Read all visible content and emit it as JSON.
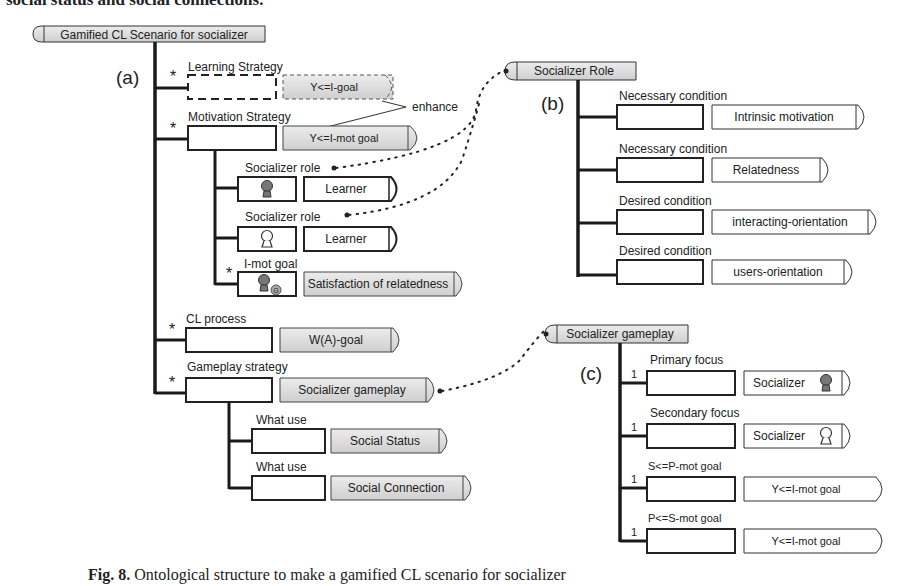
{
  "page": {
    "top_text": "social status and social connections.",
    "caption": {
      "label": "Fig. 8.",
      "text": "Ontological structure to make a gamified CL scenario for socializer"
    }
  },
  "panel_a": {
    "label": "(a)",
    "root": "Gamified CL Scenario for socializer",
    "learning_strategy": {
      "role": "Learning Strategy",
      "value": "Y<=I-goal",
      "cardinality": "*"
    },
    "enhance_label": "enhance",
    "motivation_strategy": {
      "role": "Motivation Strategy",
      "value": "Y<=I-mot goal",
      "cardinality": "*"
    },
    "socializer_role_1": {
      "role": "Socializer role",
      "value": "Learner",
      "icon": "person-filled-icon"
    },
    "socializer_role_2": {
      "role": "Socializer role",
      "value": "Learner",
      "icon": "person-outline-icon"
    },
    "i_mot_goal": {
      "role": "I-mot goal",
      "value": "Satisfaction of relatedness",
      "cardinality": "*",
      "icon": "person-goal-icon"
    },
    "cl_process": {
      "role": "CL process",
      "value": "W(A)-goal",
      "cardinality": "*"
    },
    "gameplay_strategy": {
      "role": "Gameplay strategy",
      "value": "Socializer gameplay",
      "cardinality": "*"
    },
    "what_use_1": {
      "role": "What use",
      "value": "Social Status"
    },
    "what_use_2": {
      "role": "What use",
      "value": "Social Connection"
    }
  },
  "panel_b": {
    "label": "(b)",
    "root": "Socializer Role",
    "items": [
      {
        "role": "Necessary condition",
        "value": "Intrinsic motivation"
      },
      {
        "role": "Necessary condition",
        "value": "Relatedness"
      },
      {
        "role": "Desired condition",
        "value": "interacting-orientation"
      },
      {
        "role": "Desired condition",
        "value": "users-orientation"
      }
    ]
  },
  "panel_c": {
    "label": "(c)",
    "root": "Socializer gameplay",
    "items": [
      {
        "role": "Primary focus",
        "value": "Socializer",
        "cardinality": "1",
        "icon": "person-filled-icon"
      },
      {
        "role": "Secondary focus",
        "value": "Socializer",
        "cardinality": "1",
        "icon": "person-outline-icon"
      },
      {
        "role": "S<=P-mot goal",
        "value": "Y<=I-mot goal",
        "cardinality": "1"
      },
      {
        "role": "P<=S-mot goal",
        "value": "Y<=I-mot goal",
        "cardinality": "1"
      }
    ]
  },
  "colors": {
    "concept_fill": "#d9d9d9",
    "line": "#1a1a1a",
    "background": "#ffffff"
  }
}
